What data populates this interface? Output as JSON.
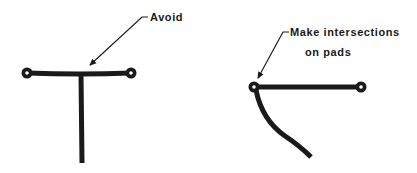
{
  "figures": [
    {
      "name": "avoid-example",
      "label": "Avoid",
      "description": "T-junction between pads"
    },
    {
      "name": "preferred-example",
      "label_line1": "Make intersections",
      "label_line2": "on pads",
      "description": "Trace intersection placed on pad"
    }
  ],
  "colors": {
    "ink": "#1a1a1a",
    "background": "#ffffff"
  }
}
